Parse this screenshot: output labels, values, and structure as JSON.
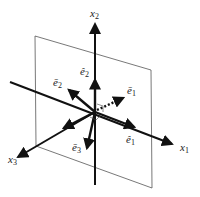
{
  "diagram": {
    "type": "3d-coordinate-basis-vectors",
    "axes": {
      "x1": {
        "base": "x",
        "sub": "1"
      },
      "x2": {
        "base": "x",
        "sub": "2"
      },
      "x3": {
        "base": "x",
        "sub": "3"
      }
    },
    "vectors": {
      "e_hat_1": {
        "base": "ê",
        "sub": "1"
      },
      "e_hat_2": {
        "base": "ê",
        "sub": "2"
      },
      "e_bar_1": {
        "base": "ē",
        "sub": "1"
      },
      "e_bar_2": {
        "base": "ē",
        "sub": "2"
      },
      "e_bar_3": {
        "base": "ē",
        "sub": "3"
      }
    },
    "colors": {
      "ink": "#111111",
      "plane": "#555555",
      "background": "#ffffff"
    }
  }
}
